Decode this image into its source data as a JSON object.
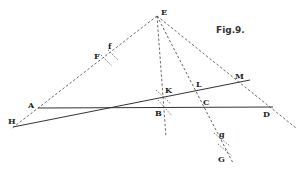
{
  "figure": {
    "title": "Fig.9.",
    "points": [
      {
        "name": "E",
        "x": 157,
        "y": 16,
        "lx": 161,
        "ly": 15
      },
      {
        "name": "f",
        "x": 112,
        "y": 53,
        "lx": 108,
        "ly": 49
      },
      {
        "name": "F",
        "x": 104,
        "y": 59,
        "lx": 94,
        "ly": 59
      },
      {
        "name": "A",
        "x": 38,
        "y": 108,
        "lx": 28,
        "ly": 108
      },
      {
        "name": "H",
        "x": 13,
        "y": 127,
        "lx": 8,
        "ly": 124
      },
      {
        "name": "K",
        "x": 163,
        "y": 97,
        "lx": 165,
        "ly": 93
      },
      {
        "name": "B",
        "x": 164,
        "y": 108,
        "lx": 155,
        "ly": 116
      },
      {
        "name": "L",
        "x": 201,
        "y": 90,
        "lx": 196,
        "ly": 87
      },
      {
        "name": "C",
        "x": 204,
        "y": 107,
        "lx": 203,
        "ly": 105
      },
      {
        "name": "M",
        "x": 248,
        "y": 80,
        "lx": 235,
        "ly": 79
      },
      {
        "name": "D",
        "x": 270,
        "y": 107,
        "lx": 263,
        "ly": 117
      },
      {
        "name": "g",
        "x": 222,
        "y": 140,
        "lx": 219,
        "ly": 137
      },
      {
        "name": "G",
        "x": 227,
        "y": 150,
        "lx": 218,
        "ly": 162
      }
    ],
    "solid_lines": [
      {
        "from": "A",
        "to": "D",
        "x1": 38,
        "y1": 108,
        "x2": 273,
        "y2": 107
      },
      {
        "from": "H",
        "to": "M",
        "x1": 13,
        "y1": 127,
        "x2": 250,
        "y2": 80
      }
    ],
    "dashed_lines": [
      {
        "from": "E",
        "to": "H",
        "x1": 157,
        "y1": 16,
        "x2": 11,
        "y2": 129
      },
      {
        "from": "E",
        "to": "B",
        "x1": 157,
        "y1": 16,
        "x2": 166,
        "y2": 137
      },
      {
        "from": "E",
        "to": "G",
        "x1": 157,
        "y1": 16,
        "x2": 233,
        "y2": 163
      },
      {
        "from": "E",
        "to": "D",
        "x1": 157,
        "y1": 16,
        "x2": 296,
        "y2": 128
      }
    ]
  }
}
